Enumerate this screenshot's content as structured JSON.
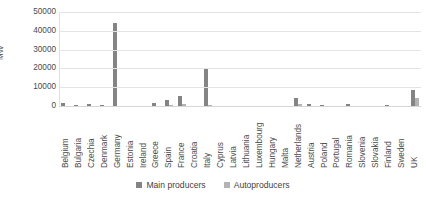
{
  "chart_data": {
    "type": "bar",
    "title": "",
    "xlabel": "",
    "ylabel": "MW",
    "ylim": [
      0,
      50000
    ],
    "yticks": [
      "0",
      "10000",
      "20000",
      "30000",
      "40000",
      "50000"
    ],
    "ytick_values": [
      0,
      10000,
      20000,
      30000,
      40000,
      50000
    ],
    "grid": true,
    "legend_position": "bottom",
    "categories": [
      "Belgium",
      "Bulgaria",
      "Czechia",
      "Denmark",
      "Germany",
      "Estonia",
      "Ireland",
      "Greece",
      "Spain",
      "France",
      "Croatia",
      "Italy",
      "Cyprus",
      "Latvia",
      "Lithuania",
      "Luxembourg",
      "Hungary",
      "Malta",
      "Netherlands",
      "Austria",
      "Poland",
      "Portugal",
      "Romania",
      "Slovenia",
      "Slovakia",
      "Finland",
      "Sweden",
      "UK"
    ],
    "series": [
      {
        "name": "Main producers",
        "color": "#848484",
        "values": [
          1600,
          700,
          1200,
          600,
          44000,
          0,
          0,
          1500,
          3300,
          5200,
          0,
          19500,
          0,
          0,
          0,
          0,
          0,
          0,
          4000,
          1200,
          500,
          0,
          1100,
          0,
          0,
          400,
          250,
          8500
        ]
      },
      {
        "name": "Autoproducers",
        "color": "#b3b3b3",
        "values": [
          0,
          0,
          0,
          0,
          0,
          0,
          0,
          0,
          700,
          1200,
          0,
          400,
          0,
          0,
          0,
          0,
          0,
          0,
          900,
          0,
          0,
          0,
          0,
          0,
          0,
          0,
          0,
          4200
        ]
      }
    ]
  },
  "legend": {
    "entries": [
      {
        "label": "Main producers",
        "color": "#848484"
      },
      {
        "label": "Autoproducers",
        "color": "#b3b3b3"
      }
    ]
  }
}
